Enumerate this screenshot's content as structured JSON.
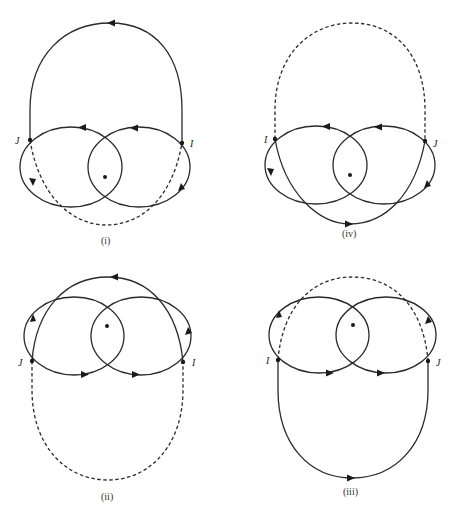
{
  "figure": {
    "panels": [
      {
        "id": "i",
        "caption": "(i)",
        "left_point_label": "J",
        "right_point_label": "I",
        "outer_arc": "top",
        "outer_arc_style": "solid",
        "inner_arc": "bottom",
        "inner_arc_style": "dashed"
      },
      {
        "id": "iv",
        "caption": "(iv)",
        "left_point_label": "I",
        "right_point_label": "J",
        "outer_arc": "top",
        "outer_arc_style": "dashed",
        "inner_arc": "bottom",
        "inner_arc_style": "solid"
      },
      {
        "id": "ii",
        "caption": "(ii)",
        "left_point_label": "J",
        "right_point_label": "I",
        "outer_arc": "bottom",
        "outer_arc_style": "dashed",
        "inner_arc": "top",
        "inner_arc_style": "solid"
      },
      {
        "id": "iii",
        "caption": "(iii)",
        "left_point_label": "I",
        "right_point_label": "J",
        "outer_arc": "bottom",
        "outer_arc_style": "solid",
        "inner_arc": "top",
        "inner_arc_style": "dashed"
      }
    ],
    "colors": {
      "stroke": "#2a2a2a",
      "background": "#ffffff"
    }
  }
}
